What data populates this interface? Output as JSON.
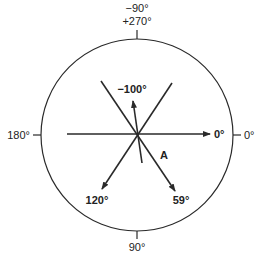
{
  "diagram": {
    "type": "phase-angle-circle",
    "colors": {
      "line": "#2a2a2a",
      "text": "#222222",
      "background": "#ffffff"
    },
    "circle": {
      "cx": 137,
      "cy": 135,
      "r": 96
    },
    "axis_labels": {
      "top_line1": "−90°",
      "top_line2": "+270°",
      "left": "180°",
      "right": "0°",
      "bottom": "90°"
    },
    "vectors": [
      {
        "id": "v0",
        "label": "0°",
        "angle_deg": 0
      },
      {
        "id": "v59",
        "label": "59°",
        "angle_deg": 59
      },
      {
        "id": "v120",
        "label": "120°",
        "angle_deg": 120
      },
      {
        "id": "vm100",
        "label": "−100°",
        "angle_deg": -100
      }
    ],
    "annotation": "A"
  }
}
